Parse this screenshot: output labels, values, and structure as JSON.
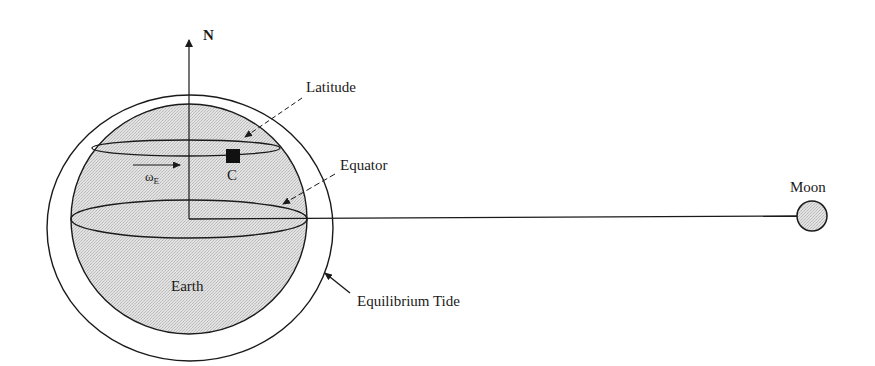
{
  "diagram": {
    "type": "earth-moon equilibrium tide schematic",
    "labels": {
      "north": "N",
      "latitude": "Latitude",
      "equator": "Equator",
      "omega_main": "ω",
      "omega_sub": "E",
      "point_c": "C",
      "earth": "Earth",
      "moon": "Moon",
      "equilibrium_tide": "Equilibrium Tide"
    },
    "colors": {
      "stroke": "#1a1a1a",
      "earth_fill": "#d9d9d9",
      "moon_fill": "#dcdcdc",
      "tide_fill": "#ffffff",
      "point_fill": "#111111"
    }
  }
}
